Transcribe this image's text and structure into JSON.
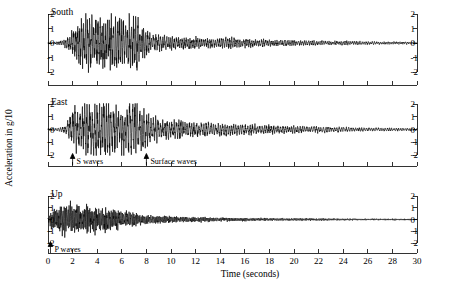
{
  "chart_data": {
    "type": "line",
    "title": "",
    "subtitle": "",
    "xlabel": "Time (seconds)",
    "ylabel": "Acceleration in g/10",
    "xlim": [
      0,
      30
    ],
    "ylim": [
      -2,
      2
    ],
    "xticks": [
      0,
      2,
      4,
      6,
      8,
      10,
      12,
      14,
      16,
      18,
      20,
      22,
      24,
      26,
      28,
      30
    ],
    "xtick_labels": [
      "0",
      "2",
      "4",
      "6",
      "8",
      "10",
      "12",
      "14",
      "16",
      "18",
      "20",
      "22",
      "24",
      "26",
      "28",
      "30"
    ],
    "yticks": [
      2,
      1,
      0,
      -1,
      -2
    ],
    "ytick_labels": [
      "2",
      "1",
      "0",
      "-1",
      "-2"
    ],
    "grid": false,
    "legend": "none",
    "panels": [
      {
        "name": "South",
        "label": "South",
        "ylim": [
          -2,
          2
        ],
        "yticks": [
          2,
          1,
          0,
          -1,
          -2
        ],
        "ytick_labels": [
          "2",
          "1",
          "0",
          "-1",
          "-2"
        ],
        "has_xtick_labels": false,
        "annotations": [],
        "envelope": [
          {
            "t": 0.0,
            "a": 0.05
          },
          {
            "t": 0.6,
            "a": 0.07
          },
          {
            "t": 1.2,
            "a": 0.12
          },
          {
            "t": 1.8,
            "a": 0.45
          },
          {
            "t": 2.2,
            "a": 1.05
          },
          {
            "t": 2.6,
            "a": 1.55
          },
          {
            "t": 3.0,
            "a": 1.25
          },
          {
            "t": 3.4,
            "a": 1.55
          },
          {
            "t": 3.8,
            "a": 1.15
          },
          {
            "t": 4.2,
            "a": 1.35
          },
          {
            "t": 4.6,
            "a": 1.0
          },
          {
            "t": 5.0,
            "a": 1.45
          },
          {
            "t": 5.4,
            "a": 1.3
          },
          {
            "t": 5.8,
            "a": 1.5
          },
          {
            "t": 6.2,
            "a": 1.2
          },
          {
            "t": 6.6,
            "a": 1.4
          },
          {
            "t": 7.0,
            "a": 1.45
          },
          {
            "t": 7.4,
            "a": 1.0
          },
          {
            "t": 7.8,
            "a": 0.85
          },
          {
            "t": 8.4,
            "a": 0.55
          },
          {
            "t": 9.0,
            "a": 0.42
          },
          {
            "t": 10.0,
            "a": 0.35
          },
          {
            "t": 11.0,
            "a": 0.3
          },
          {
            "t": 12.0,
            "a": 0.3
          },
          {
            "t": 13.0,
            "a": 0.28
          },
          {
            "t": 14.0,
            "a": 0.26
          },
          {
            "t": 15.0,
            "a": 0.3
          },
          {
            "t": 16.0,
            "a": 0.24
          },
          {
            "t": 17.0,
            "a": 0.2
          },
          {
            "t": 18.0,
            "a": 0.18
          },
          {
            "t": 20.0,
            "a": 0.15
          },
          {
            "t": 22.0,
            "a": 0.12
          },
          {
            "t": 24.0,
            "a": 0.1
          },
          {
            "t": 26.0,
            "a": 0.08
          },
          {
            "t": 28.0,
            "a": 0.07
          },
          {
            "t": 30.0,
            "a": 0.06
          }
        ],
        "freq": 4.6,
        "seed": 17
      },
      {
        "name": "East",
        "label": "East",
        "ylim": [
          -2,
          2
        ],
        "yticks": [
          2,
          1,
          0,
          -1,
          -2
        ],
        "ytick_labels": [
          "2",
          "1",
          "0",
          "-1",
          "-2"
        ],
        "has_xtick_labels": false,
        "annotations": [
          {
            "name": "s-waves",
            "label": "S waves",
            "t": 2.0
          },
          {
            "name": "surface-waves",
            "label": "Surface waves",
            "t": 8.0
          }
        ],
        "envelope": [
          {
            "t": 0.0,
            "a": 0.06
          },
          {
            "t": 0.8,
            "a": 0.1
          },
          {
            "t": 1.4,
            "a": 0.2
          },
          {
            "t": 1.9,
            "a": 0.9
          },
          {
            "t": 2.3,
            "a": 1.35
          },
          {
            "t": 2.7,
            "a": 1.1
          },
          {
            "t": 3.1,
            "a": 1.75
          },
          {
            "t": 3.5,
            "a": 1.45
          },
          {
            "t": 3.9,
            "a": 1.9
          },
          {
            "t": 4.3,
            "a": 1.5
          },
          {
            "t": 4.7,
            "a": 1.85
          },
          {
            "t": 5.1,
            "a": 1.3
          },
          {
            "t": 5.5,
            "a": 1.6
          },
          {
            "t": 5.9,
            "a": 1.4
          },
          {
            "t": 6.3,
            "a": 1.2
          },
          {
            "t": 6.8,
            "a": 1.7
          },
          {
            "t": 7.2,
            "a": 1.95
          },
          {
            "t": 7.6,
            "a": 1.3
          },
          {
            "t": 8.0,
            "a": 1.0
          },
          {
            "t": 8.6,
            "a": 0.8
          },
          {
            "t": 9.2,
            "a": 0.6
          },
          {
            "t": 10.0,
            "a": 0.52
          },
          {
            "t": 11.0,
            "a": 0.5
          },
          {
            "t": 12.0,
            "a": 0.45
          },
          {
            "t": 13.0,
            "a": 0.42
          },
          {
            "t": 14.0,
            "a": 0.4
          },
          {
            "t": 15.0,
            "a": 0.35
          },
          {
            "t": 16.0,
            "a": 0.32
          },
          {
            "t": 17.0,
            "a": 0.3
          },
          {
            "t": 18.0,
            "a": 0.26
          },
          {
            "t": 20.0,
            "a": 0.22
          },
          {
            "t": 22.0,
            "a": 0.18
          },
          {
            "t": 24.0,
            "a": 0.14
          },
          {
            "t": 26.0,
            "a": 0.11
          },
          {
            "t": 28.0,
            "a": 0.09
          },
          {
            "t": 30.0,
            "a": 0.08
          }
        ],
        "freq": 3.9,
        "seed": 43
      },
      {
        "name": "Up",
        "label": "Up",
        "ylim": [
          -2,
          2
        ],
        "yticks": [
          2,
          1,
          0,
          -1,
          -2
        ],
        "ytick_labels": [
          "2",
          "1",
          "0",
          "-1",
          "-2"
        ],
        "has_xtick_labels": true,
        "annotations": [
          {
            "name": "p-waves",
            "label": "P waves",
            "t": 0.2
          }
        ],
        "envelope": [
          {
            "t": 0.0,
            "a": 0.15
          },
          {
            "t": 0.3,
            "a": 0.6
          },
          {
            "t": 0.7,
            "a": 0.75
          },
          {
            "t": 1.1,
            "a": 0.9
          },
          {
            "t": 1.5,
            "a": 1.0
          },
          {
            "t": 1.9,
            "a": 0.85
          },
          {
            "t": 2.3,
            "a": 0.95
          },
          {
            "t": 2.7,
            "a": 0.8
          },
          {
            "t": 3.1,
            "a": 0.9
          },
          {
            "t": 3.5,
            "a": 0.75
          },
          {
            "t": 3.9,
            "a": 0.85
          },
          {
            "t": 4.3,
            "a": 0.7
          },
          {
            "t": 4.7,
            "a": 0.8
          },
          {
            "t": 5.1,
            "a": 0.65
          },
          {
            "t": 5.5,
            "a": 0.7
          },
          {
            "t": 5.9,
            "a": 0.6
          },
          {
            "t": 6.3,
            "a": 0.55
          },
          {
            "t": 6.8,
            "a": 0.45
          },
          {
            "t": 7.3,
            "a": 0.38
          },
          {
            "t": 8.0,
            "a": 0.3
          },
          {
            "t": 9.0,
            "a": 0.24
          },
          {
            "t": 10.0,
            "a": 0.22
          },
          {
            "t": 11.0,
            "a": 0.18
          },
          {
            "t": 12.0,
            "a": 0.16
          },
          {
            "t": 13.0,
            "a": 0.15
          },
          {
            "t": 14.0,
            "a": 0.13
          },
          {
            "t": 15.0,
            "a": 0.12
          },
          {
            "t": 16.0,
            "a": 0.11
          },
          {
            "t": 17.0,
            "a": 0.1
          },
          {
            "t": 18.0,
            "a": 0.09
          },
          {
            "t": 20.0,
            "a": 0.08
          },
          {
            "t": 22.0,
            "a": 0.07
          },
          {
            "t": 24.0,
            "a": 0.06
          },
          {
            "t": 26.0,
            "a": 0.05
          },
          {
            "t": 28.0,
            "a": 0.05
          },
          {
            "t": 30.0,
            "a": 0.04
          }
        ],
        "freq": 7.5,
        "seed": 91
      }
    ]
  },
  "figure": {
    "ylabel": "Acceleration in g/10",
    "xlabel": "Time (seconds)"
  }
}
